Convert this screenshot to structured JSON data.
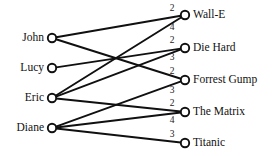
{
  "diagram": {
    "type": "bipartite-graph",
    "title": "",
    "left_column_label": "",
    "right_column_label": "",
    "colors": {
      "edge": "#101010",
      "node_stroke": "#101010",
      "node_fill": "#ffffff",
      "text": "#111111",
      "background": "#ffffff"
    },
    "left_nodes": [
      {
        "id": "john",
        "label": "John",
        "x": 52,
        "y": 38
      },
      {
        "id": "lucy",
        "label": "Lucy",
        "x": 52,
        "y": 68
      },
      {
        "id": "eric",
        "label": "Eric",
        "x": 52,
        "y": 98
      },
      {
        "id": "diane",
        "label": "Diane",
        "x": 52,
        "y": 128
      }
    ],
    "right_nodes": [
      {
        "id": "walle",
        "label": "Wall-E",
        "x": 185,
        "y": 15
      },
      {
        "id": "diehard",
        "label": "Die Hard",
        "x": 185,
        "y": 48
      },
      {
        "id": "forrest",
        "label": "Forrest Gump",
        "x": 185,
        "y": 80
      },
      {
        "id": "matrix",
        "label": "The Matrix",
        "x": 185,
        "y": 112
      },
      {
        "id": "titanic",
        "label": "Titanic",
        "x": 185,
        "y": 143
      }
    ],
    "edges": [
      {
        "from": "john",
        "to": "walle",
        "weight": "2",
        "wx": 172,
        "wy": 9
      },
      {
        "from": "eric",
        "to": "walle",
        "weight": "4",
        "wx": 172,
        "wy": 28
      },
      {
        "from": "lucy",
        "to": "diehard",
        "weight": "2",
        "wx": 172,
        "wy": 41
      },
      {
        "from": "eric",
        "to": "diehard",
        "weight": "3",
        "wx": 172,
        "wy": 58
      },
      {
        "from": "john",
        "to": "forrest",
        "weight": "2",
        "wx": 172,
        "wy": 72
      },
      {
        "from": "diane",
        "to": "forrest",
        "weight": "3",
        "wx": 172,
        "wy": 91
      },
      {
        "from": "eric",
        "to": "matrix",
        "weight": "2",
        "wx": 172,
        "wy": 104
      },
      {
        "from": "diane",
        "to": "matrix",
        "weight": "4",
        "wx": 172,
        "wy": 121
      },
      {
        "from": "diane",
        "to": "titanic",
        "weight": "3",
        "wx": 172,
        "wy": 135
      }
    ]
  }
}
